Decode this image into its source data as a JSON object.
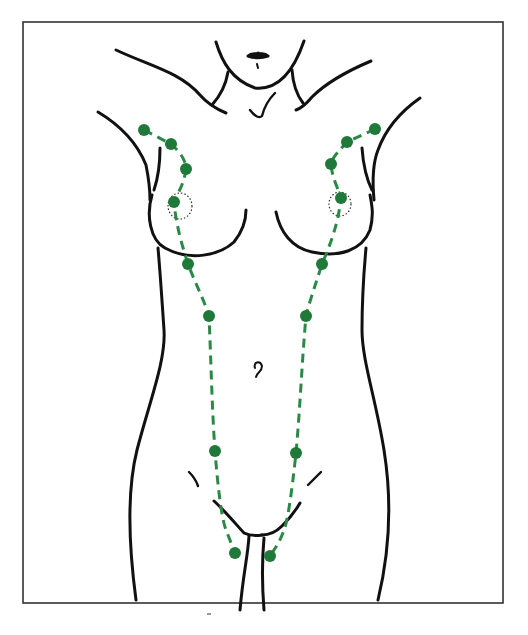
{
  "figure": {
    "colors": {
      "outline": "#111111",
      "dot": "#1f7a3a",
      "dash": "#2a8a45",
      "areola": "#333333",
      "frame": "#333333",
      "background": "#ffffff"
    },
    "frame": {
      "x": 23,
      "y": 22,
      "width": 480,
      "height": 581
    },
    "dots_left": [
      {
        "x": 144,
        "y": 130
      },
      {
        "x": 171,
        "y": 144
      },
      {
        "x": 186,
        "y": 169
      },
      {
        "x": 174,
        "y": 202
      },
      {
        "x": 188,
        "y": 264
      },
      {
        "x": 209,
        "y": 316
      },
      {
        "x": 215,
        "y": 451
      },
      {
        "x": 235,
        "y": 553
      }
    ],
    "dots_right": [
      {
        "x": 375,
        "y": 129
      },
      {
        "x": 347,
        "y": 142
      },
      {
        "x": 331,
        "y": 164
      },
      {
        "x": 341,
        "y": 198
      },
      {
        "x": 322,
        "y": 264
      },
      {
        "x": 306,
        "y": 316
      },
      {
        "x": 296,
        "y": 453
      },
      {
        "x": 270,
        "y": 556
      }
    ],
    "dot_radius": 6
  }
}
